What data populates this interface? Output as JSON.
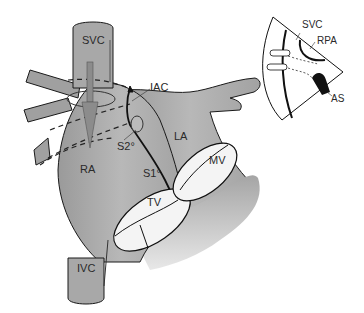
{
  "diagram": {
    "type": "anatomical-illustration",
    "colors": {
      "tissue_fill": "#a9a9a9",
      "tissue_light": "#c4c4c4",
      "outline": "#1a1a1a",
      "valve_fill": "#f4f4f4",
      "arrow_fill": "#8c8c8c",
      "background": "#ffffff"
    },
    "labels": {
      "svc": "SVC",
      "iac": "IAC",
      "s2": "S2°",
      "la": "LA",
      "ra": "RA",
      "s1": "S1°",
      "mv": "MV",
      "tv": "TV",
      "ivc": "IVC"
    },
    "inset": {
      "labels": {
        "svc": "SVC",
        "rpa": "RPA",
        "as": "AS"
      }
    }
  }
}
